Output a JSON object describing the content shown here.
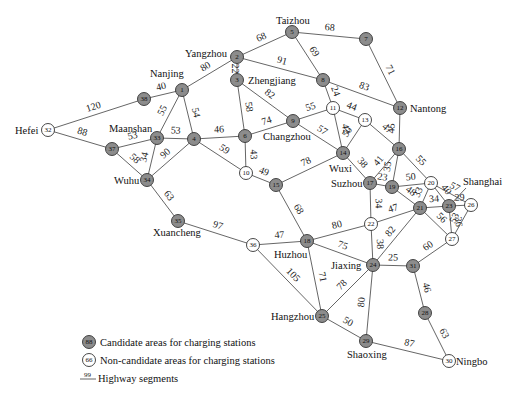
{
  "diagram": {
    "type": "weighted-network",
    "colors": {
      "candidate_fill": "#8c8c8c",
      "noncandidate_fill": "#ffffff",
      "edge": "#555555"
    },
    "nodes": [
      {
        "id": 1,
        "x": 182,
        "y": 90,
        "candidate": true,
        "label": "Nanjing",
        "lx": 150,
        "ly": 77
      },
      {
        "id": 2,
        "x": 237,
        "y": 57,
        "candidate": true,
        "label": "Yangzhou",
        "lx": 185,
        "ly": 57
      },
      {
        "id": 3,
        "x": 237,
        "y": 80,
        "candidate": true,
        "label": "Zhengjiang",
        "lx": 248,
        "ly": 84
      },
      {
        "id": 4,
        "x": 194,
        "y": 139,
        "candidate": true
      },
      {
        "id": 5,
        "x": 292,
        "y": 32,
        "candidate": true,
        "label": "Taizhou",
        "lx": 276,
        "ly": 24
      },
      {
        "id": 6,
        "x": 245,
        "y": 136,
        "candidate": true
      },
      {
        "id": 7,
        "x": 366,
        "y": 39,
        "candidate": true
      },
      {
        "id": 8,
        "x": 323,
        "y": 80,
        "candidate": true
      },
      {
        "id": 9,
        "x": 293,
        "y": 121,
        "candidate": true,
        "label": "Changzhou",
        "lx": 263,
        "ly": 140
      },
      {
        "id": 10,
        "x": 246,
        "y": 173,
        "candidate": false
      },
      {
        "id": 11,
        "x": 333,
        "y": 108,
        "candidate": false
      },
      {
        "id": 12,
        "x": 400,
        "y": 108,
        "candidate": true,
        "label": "Nantong",
        "lx": 410,
        "ly": 112
      },
      {
        "id": 13,
        "x": 365,
        "y": 120,
        "candidate": false
      },
      {
        "id": 14,
        "x": 343,
        "y": 153,
        "candidate": true,
        "label": "Wuxi",
        "lx": 329,
        "ly": 172
      },
      {
        "id": 15,
        "x": 276,
        "y": 185,
        "candidate": true
      },
      {
        "id": 16,
        "x": 399,
        "y": 149,
        "candidate": true
      },
      {
        "id": 17,
        "x": 370,
        "y": 183,
        "candidate": true,
        "label": "Suzhou",
        "lx": 331,
        "ly": 187
      },
      {
        "id": 18,
        "x": 307,
        "y": 241,
        "candidate": true,
        "label": "Huzhou",
        "lx": 274,
        "ly": 258
      },
      {
        "id": 19,
        "x": 392,
        "y": 187,
        "candidate": true
      },
      {
        "id": 20,
        "x": 431,
        "y": 183,
        "candidate": false
      },
      {
        "id": 21,
        "x": 420,
        "y": 208,
        "candidate": true
      },
      {
        "id": 22,
        "x": 371,
        "y": 224,
        "candidate": false
      },
      {
        "id": 23,
        "x": 449,
        "y": 206,
        "candidate": true,
        "label": "Shanghai",
        "lx": 463,
        "ly": 185
      },
      {
        "id": 24,
        "x": 373,
        "y": 265,
        "candidate": true,
        "label": "Jiaxing",
        "lx": 331,
        "ly": 269
      },
      {
        "id": 25,
        "x": 322,
        "y": 316,
        "candidate": true,
        "label": "Hangzhou",
        "lx": 271,
        "ly": 320
      },
      {
        "id": 26,
        "x": 471,
        "y": 205,
        "candidate": false
      },
      {
        "id": 27,
        "x": 452,
        "y": 239,
        "candidate": false
      },
      {
        "id": 28,
        "x": 425,
        "y": 313,
        "candidate": true
      },
      {
        "id": 29,
        "x": 366,
        "y": 341,
        "candidate": true,
        "label": "Shaoxing",
        "lx": 347,
        "ly": 358
      },
      {
        "id": 30,
        "x": 449,
        "y": 361,
        "candidate": false,
        "label": "Ningbo",
        "lx": 456,
        "ly": 365
      },
      {
        "id": 31,
        "x": 413,
        "y": 266,
        "candidate": true
      },
      {
        "id": 32,
        "x": 48,
        "y": 130,
        "candidate": false,
        "label": "Hefei",
        "lx": 15,
        "ly": 134
      },
      {
        "id": 33,
        "x": 157,
        "y": 138,
        "candidate": true,
        "label": "Maanshan",
        "lx": 109,
        "ly": 132
      },
      {
        "id": 34,
        "x": 147,
        "y": 180,
        "candidate": true,
        "label": "Wuhu",
        "lx": 114,
        "ly": 184
      },
      {
        "id": 35,
        "x": 178,
        "y": 221,
        "candidate": true,
        "label": "Xuancheng",
        "lx": 153,
        "ly": 236
      },
      {
        "id": 36,
        "x": 253,
        "y": 245,
        "candidate": false
      },
      {
        "id": 37,
        "x": 112,
        "y": 149,
        "candidate": true
      },
      {
        "id": 38,
        "x": 144,
        "y": 99,
        "candidate": true
      }
    ],
    "edges": [
      {
        "a": 32,
        "b": 38,
        "w": 120
      },
      {
        "a": 32,
        "b": 37,
        "w": 88
      },
      {
        "a": 38,
        "b": 1,
        "w": 40
      },
      {
        "a": 1,
        "b": 2,
        "w": 80
      },
      {
        "a": 1,
        "b": 33,
        "w": 55
      },
      {
        "a": 1,
        "b": 4,
        "w": 54
      },
      {
        "a": 37,
        "b": 33,
        "w": 53
      },
      {
        "a": 33,
        "b": 4,
        "w": 53
      },
      {
        "a": 37,
        "b": 34,
        "w": 58
      },
      {
        "a": 33,
        "b": 34,
        "w": 34
      },
      {
        "a": 34,
        "b": 4,
        "w": 90
      },
      {
        "a": 34,
        "b": 35,
        "w": 63
      },
      {
        "a": 4,
        "b": 6,
        "w": 46
      },
      {
        "a": 4,
        "b": 10,
        "w": 59
      },
      {
        "a": 2,
        "b": 5,
        "w": 68
      },
      {
        "a": 2,
        "b": 3,
        "w": 22
      },
      {
        "a": 2,
        "b": 8,
        "w": 91
      },
      {
        "a": 3,
        "b": 6,
        "w": 58
      },
      {
        "a": 3,
        "b": 9,
        "w": 82
      },
      {
        "a": 5,
        "b": 7,
        "w": 68
      },
      {
        "a": 5,
        "b": 8,
        "w": 69
      },
      {
        "a": 7,
        "b": 12,
        "w": 71
      },
      {
        "a": 8,
        "b": 12,
        "w": 83
      },
      {
        "a": 8,
        "b": 11,
        "w": 24
      },
      {
        "a": 6,
        "b": 9,
        "w": 74
      },
      {
        "a": 6,
        "b": 10,
        "w": 43
      },
      {
        "a": 9,
        "b": 11,
        "w": 55
      },
      {
        "a": 9,
        "b": 14,
        "w": 57
      },
      {
        "a": 11,
        "b": 13,
        "w": 44
      },
      {
        "a": 11,
        "b": 14,
        "w": 42
      },
      {
        "a": 13,
        "b": 14,
        "w": 50
      },
      {
        "a": 13,
        "b": 16,
        "w": 47
      },
      {
        "a": 12,
        "b": 16,
        "w": 45
      },
      {
        "a": 10,
        "b": 15,
        "w": 49
      },
      {
        "a": 15,
        "b": 14,
        "w": 78
      },
      {
        "a": 15,
        "b": 18,
        "w": 68
      },
      {
        "a": 14,
        "b": 17,
        "w": 38
      },
      {
        "a": 16,
        "b": 17,
        "w": 41
      },
      {
        "a": 16,
        "b": 19,
        "w": 35
      },
      {
        "a": 16,
        "b": 20,
        "w": 55
      },
      {
        "a": 17,
        "b": 19,
        "w": 23
      },
      {
        "a": 17,
        "b": 22,
        "w": 34
      },
      {
        "a": 19,
        "b": 20,
        "w": 50
      },
      {
        "a": 19,
        "b": 21,
        "w": 48
      },
      {
        "a": 20,
        "b": 21,
        "w": 33
      },
      {
        "a": 20,
        "b": 23,
        "w": 40
      },
      {
        "a": 20,
        "b": 26,
        "w": 57
      },
      {
        "a": 21,
        "b": 23,
        "w": 34
      },
      {
        "a": 23,
        "b": 26,
        "w": 29
      },
      {
        "a": 23,
        "b": 27,
        "w": 36
      },
      {
        "a": 21,
        "b": 27,
        "w": 56
      },
      {
        "a": 26,
        "b": 27,
        "w": 53
      },
      {
        "a": 22,
        "b": 21,
        "w": 47
      },
      {
        "a": 21,
        "b": 24,
        "w": 82
      },
      {
        "a": 22,
        "b": 24,
        "w": 38
      },
      {
        "a": 18,
        "b": 22,
        "w": 80
      },
      {
        "a": 18,
        "b": 24,
        "w": 75
      },
      {
        "a": 35,
        "b": 36,
        "w": 97
      },
      {
        "a": 36,
        "b": 18,
        "w": 47
      },
      {
        "a": 36,
        "b": 25,
        "w": 105
      },
      {
        "a": 18,
        "b": 25,
        "w": 71
      },
      {
        "a": 25,
        "b": 24,
        "w": 78
      },
      {
        "a": 24,
        "b": 29,
        "w": 80
      },
      {
        "a": 24,
        "b": 31,
        "w": 25
      },
      {
        "a": 31,
        "b": 27,
        "w": 60
      },
      {
        "a": 31,
        "b": 28,
        "w": 46
      },
      {
        "a": 28,
        "b": 30,
        "w": 63
      },
      {
        "a": 25,
        "b": 29,
        "w": 50
      },
      {
        "a": 29,
        "b": 30,
        "w": 87
      }
    ],
    "legend": {
      "candidate_symbol": "88",
      "candidate_label": "Candidate areas for charging stations",
      "noncandidate_symbol": "66",
      "noncandidate_label": "Non-candidate areas for charging stations",
      "segment_symbol": "99",
      "segment_label": "Highway segments"
    }
  }
}
